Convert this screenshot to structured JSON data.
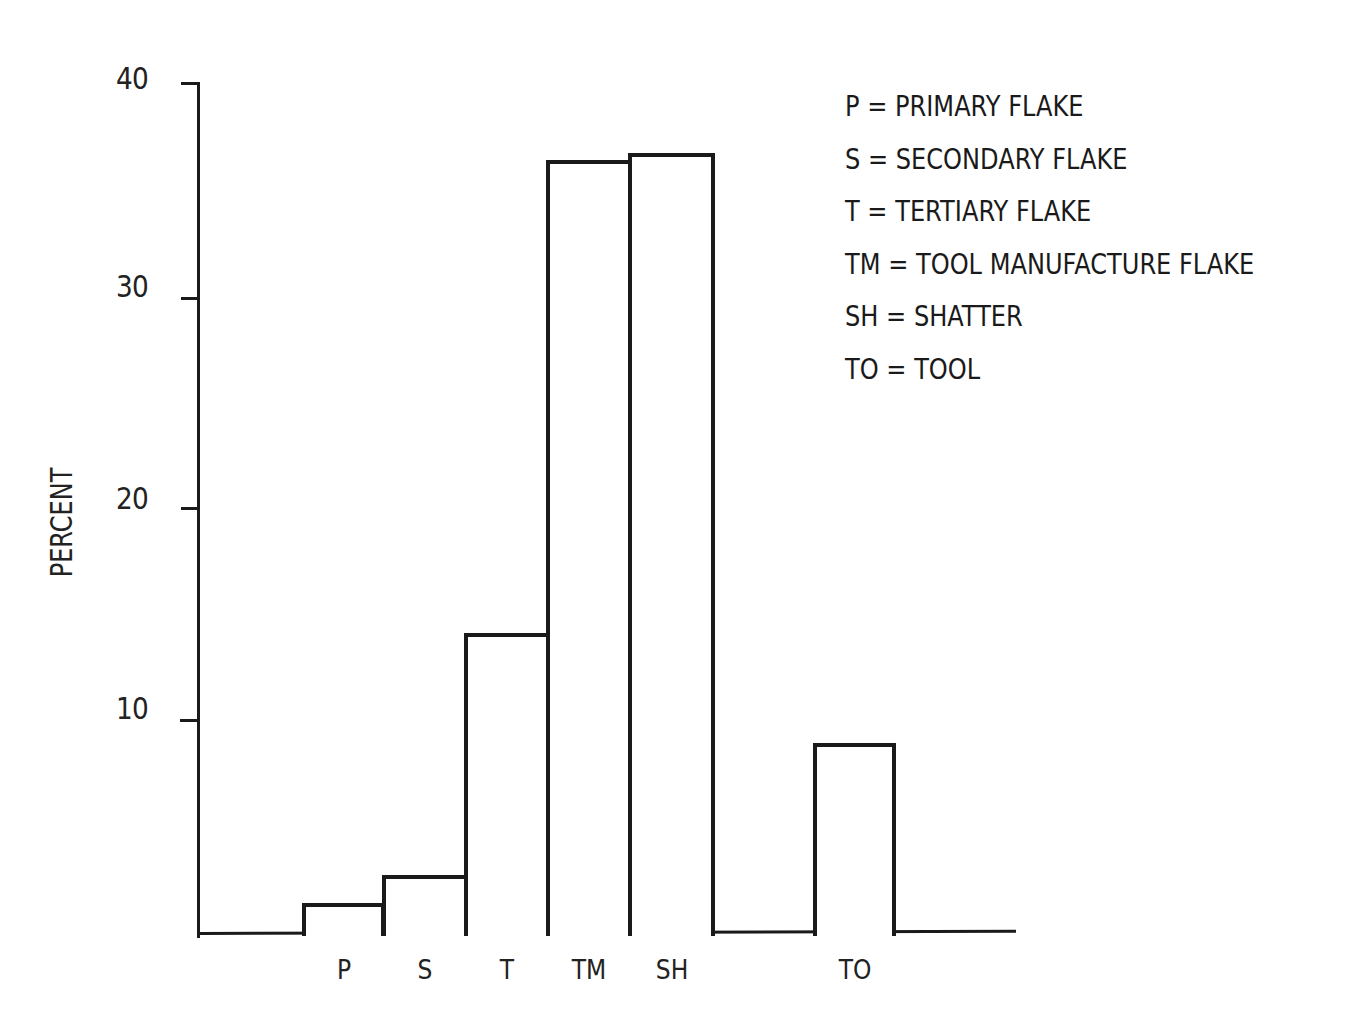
{
  "chart_data": {
    "type": "bar",
    "title": "",
    "xlabel": "",
    "ylabel": "PERCENT",
    "ylim": [
      0,
      40
    ],
    "yticks": [
      10,
      20,
      30,
      40
    ],
    "grid": false,
    "legend_position": "top-right",
    "categories": [
      "P",
      "S",
      "T",
      "TM",
      "SH",
      "TO"
    ],
    "values": [
      1.5,
      2.8,
      14.2,
      36.4,
      36.7,
      9.0
    ],
    "legend": [
      {
        "abbr": "P",
        "label": "PRIMARY FLAKE"
      },
      {
        "abbr": "S",
        "label": "SECONDARY FLAKE"
      },
      {
        "abbr": "T",
        "label": "TERTIARY FLAKE"
      },
      {
        "abbr": "TM",
        "label": "TOOL MANUFACTURE FLAKE"
      },
      {
        "abbr": "SH",
        "label": "SHATTER"
      },
      {
        "abbr": "TO",
        "label": "TOOL"
      }
    ]
  },
  "axis": {
    "y_title": "PERCENT",
    "tick_labels": [
      "40",
      "30",
      "20",
      "10"
    ]
  },
  "legend_lines": [
    "P = PRIMARY FLAKE",
    "S = SECONDARY FLAKE",
    "T = TERTIARY FLAKE",
    "TM = TOOL MANUFACTURE FLAKE",
    "SH = SHATTER",
    "TO = TOOL"
  ],
  "colors": {
    "ink": "#1a1a1a",
    "background": "#ffffff"
  }
}
